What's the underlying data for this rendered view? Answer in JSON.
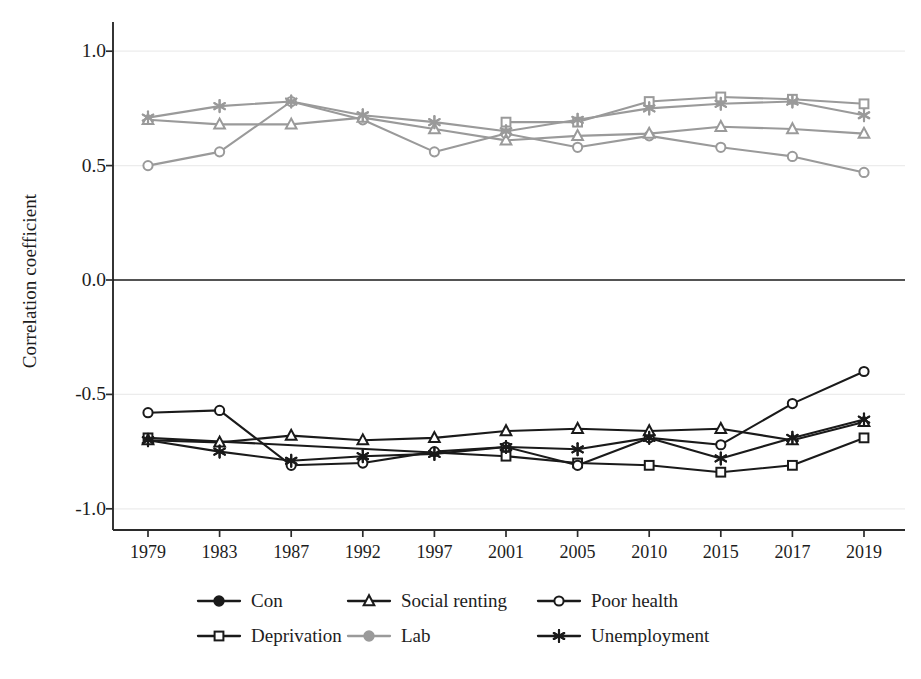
{
  "chart_data": {
    "type": "line",
    "title": "",
    "xlabel": "",
    "ylabel": "Correlation coefficient",
    "categories": [
      "1979",
      "1983",
      "1987",
      "1992",
      "1997",
      "2001",
      "2005",
      "2010",
      "2015",
      "2017",
      "2019"
    ],
    "ylim": [
      -1.15,
      1.15
    ],
    "yticks": [
      1.0,
      0.5,
      0.0,
      -0.5,
      -1.0
    ],
    "ytick_labels": [
      "1.0",
      "0.5",
      "0.0",
      "-0.5",
      "-1.0"
    ],
    "grid": "horizontal-light",
    "legend_position": "bottom",
    "zero_line": 0.0,
    "series": [
      {
        "name": "Con",
        "party": "Con",
        "color": "#1a1a1a",
        "marker": "filled-circle",
        "legend_only": true,
        "values": [
          null,
          null,
          null,
          null,
          null,
          null,
          null,
          null,
          null,
          null,
          null
        ]
      },
      {
        "name": "Lab",
        "party": "Lab",
        "color": "#9a9a9a",
        "marker": "filled-circle",
        "legend_only": true,
        "values": [
          null,
          null,
          null,
          null,
          null,
          null,
          null,
          null,
          null,
          null,
          null
        ]
      },
      {
        "name": "Deprivation",
        "group": "Lab",
        "color": "#9a9a9a",
        "marker": "square",
        "values": [
          null,
          null,
          null,
          null,
          null,
          0.69,
          0.69,
          0.78,
          0.8,
          0.79,
          0.77
        ]
      },
      {
        "name": "Poor health",
        "group": "Lab",
        "color": "#9a9a9a",
        "marker": "circle",
        "values": [
          0.5,
          0.56,
          0.78,
          0.7,
          0.56,
          0.64,
          0.58,
          0.63,
          0.58,
          0.54,
          0.47
        ]
      },
      {
        "name": "Social renting",
        "group": "Lab",
        "color": "#9a9a9a",
        "marker": "triangle",
        "values": [
          0.7,
          0.68,
          0.68,
          0.71,
          0.66,
          0.61,
          0.63,
          0.64,
          0.67,
          0.66,
          0.64
        ]
      },
      {
        "name": "Unemployment",
        "group": "Lab",
        "color": "#9a9a9a",
        "marker": "star",
        "values": [
          0.71,
          0.76,
          0.78,
          0.72,
          0.69,
          0.65,
          0.7,
          0.75,
          0.77,
          0.78,
          0.72
        ]
      },
      {
        "name": "Deprivation",
        "group": "Con",
        "color": "#1a1a1a",
        "marker": "square",
        "values": [
          -0.69,
          null,
          null,
          null,
          null,
          -0.77,
          -0.8,
          -0.81,
          -0.84,
          -0.81,
          -0.69
        ]
      },
      {
        "name": "Poor health",
        "group": "Con",
        "color": "#1a1a1a",
        "marker": "circle",
        "values": [
          -0.58,
          -0.57,
          -0.81,
          -0.8,
          -0.75,
          -0.73,
          -0.81,
          -0.69,
          -0.72,
          -0.54,
          -0.4
        ]
      },
      {
        "name": "Social renting",
        "group": "Con",
        "color": "#1a1a1a",
        "marker": "triangle",
        "values": [
          -0.7,
          -0.71,
          -0.68,
          -0.7,
          -0.69,
          -0.66,
          -0.65,
          -0.66,
          -0.65,
          -0.7,
          -0.62
        ]
      },
      {
        "name": "Unemployment",
        "group": "Con",
        "color": "#1a1a1a",
        "marker": "star",
        "values": [
          -0.7,
          -0.75,
          -0.79,
          -0.77,
          -0.76,
          -0.73,
          -0.74,
          -0.69,
          -0.78,
          -0.69,
          -0.61
        ]
      }
    ]
  },
  "axis": {
    "ylabel": "Correlation coefficient",
    "ytick_labels": [
      "1.0",
      "0.5",
      "0.0",
      "-0.5",
      "-1.0"
    ],
    "xtick_labels": [
      "1979",
      "1983",
      "1987",
      "1992",
      "1997",
      "2001",
      "2005",
      "2010",
      "2015",
      "2017",
      "2019"
    ]
  },
  "legend": {
    "entries": [
      {
        "label": "Con",
        "color": "#1a1a1a",
        "marker": "filled-circle"
      },
      {
        "label": "Deprivation",
        "color": "#1a1a1a",
        "marker": "square"
      },
      {
        "label": "Social renting",
        "color": "#1a1a1a",
        "marker": "triangle"
      },
      {
        "label": "Lab",
        "color": "#9a9a9a",
        "marker": "filled-circle"
      },
      {
        "label": "Poor health",
        "color": "#1a1a1a",
        "marker": "circle"
      },
      {
        "label": "Unemployment",
        "color": "#1a1a1a",
        "marker": "star"
      }
    ]
  },
  "colors": {
    "con": "#1a1a1a",
    "lab": "#9a9a9a",
    "axis": "#2b2b2b",
    "grid": "#ececec",
    "background": "#ffffff"
  }
}
